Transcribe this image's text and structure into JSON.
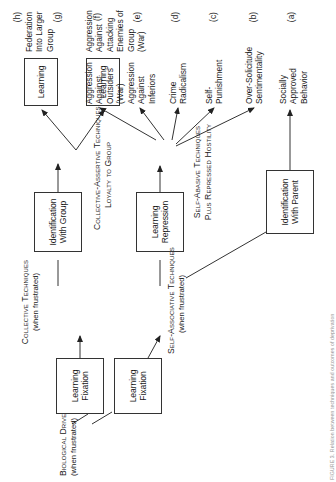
{
  "figure": {
    "caption": "FIGURE 3. Relation between techniques and outcomes of deprivation",
    "orientation_degrees": -90
  },
  "root": {
    "label_line1": "Biological Drives",
    "label_line2": "(when frustrated)"
  },
  "branches": [
    {
      "id": "self-associative",
      "stage_line1": "Self-Associative Techniques",
      "stage_line2": "(when frustrated)"
    },
    {
      "id": "collective",
      "stage_line1": "Collective Techniques",
      "stage_line2": "(when frustrated)"
    }
  ],
  "boxes": [
    {
      "id": "learning-fixation-lower",
      "line1": "Learning",
      "line2": "Fixation"
    },
    {
      "id": "learning-fixation-upper",
      "line1": "Learning",
      "line2": "Fixation"
    },
    {
      "id": "learning-repression",
      "line1": "Learning",
      "line2": "Repression"
    },
    {
      "id": "identification-with-parent",
      "line1": "Identification",
      "line2": "With Parent"
    },
    {
      "id": "identification-with-group",
      "line1": "Identification",
      "line2": "With Group"
    },
    {
      "id": "learning-g",
      "line1": "Learning",
      "line2": ""
    },
    {
      "id": "learning-h",
      "line1": "Learning",
      "line2": ""
    }
  ],
  "stages": [
    {
      "id": "self-abasive",
      "line1": "Self-Abasive Techniques",
      "line2": "Plus Repressed Hostility"
    },
    {
      "id": "collective-assertive",
      "line1": "Collective-Assertive Techniques",
      "line2": "Loyalty to Group"
    }
  ],
  "outcomes": [
    {
      "tag": "(a)",
      "lines": [
        "Socially",
        "Approved",
        "Behavior"
      ]
    },
    {
      "tag": "(b)",
      "lines": [
        "Over-Solicitude",
        "Sentimentality"
      ]
    },
    {
      "tag": "(c)",
      "lines": [
        "Self-",
        "Punishment"
      ]
    },
    {
      "tag": "(d)",
      "lines": [
        "Crime",
        "Radicalism"
      ]
    },
    {
      "tag": "(e)",
      "lines": [
        "Aggression",
        "Against",
        "Inferiors"
      ]
    },
    {
      "tag": "(f)",
      "lines": [
        "Aggression",
        "Against",
        "Outsiders",
        "(War)"
      ]
    },
    {
      "tag": "(g)",
      "lines": [
        "Aggression",
        "Against",
        "Attacking",
        "Enemies of",
        "Group",
        "(War)"
      ]
    },
    {
      "tag": "(h)",
      "lines": [
        "Federation",
        "Into Larger",
        "Group"
      ]
    }
  ],
  "colors": {
    "stroke": "#333333",
    "text": "#1a1a1a",
    "background": "#ffffff"
  }
}
